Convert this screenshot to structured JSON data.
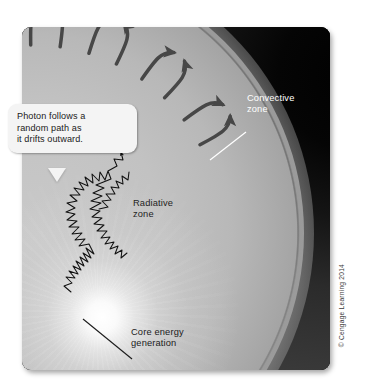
{
  "figure": {
    "background_color": "#ffffff",
    "panel_color": "#0d0d0d"
  },
  "callout": {
    "line1": "Photon follows a",
    "line2": "random path as",
    "line3": "it drifts outward.",
    "background_color": "#f4f4f4",
    "text_color": "#1b1b1b"
  },
  "labels": {
    "convective_line1": "Convective",
    "convective_line2": "zone",
    "convective_color": "#ffffff",
    "radiative_line1": "Radiative",
    "radiative_line2": "zone",
    "radiative_color": "#1e1e1e",
    "core_line1": "Core energy",
    "core_line2": "generation",
    "core_color": "#1b1b1b"
  },
  "credit": {
    "text": "© Cengage Learning 2014",
    "color": "#3a3a3a"
  },
  "zones": {
    "convective_band_color": "#9e9e9e",
    "radiative_zone_color": "#bdbdbd",
    "core_glow_color": "#ffffff",
    "arrow_color": "#474747",
    "photon_path_color": "#111111"
  }
}
